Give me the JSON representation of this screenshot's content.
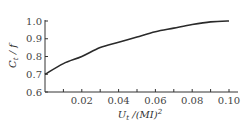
{
  "chart_data": {
    "type": "line",
    "title": "",
    "xlabel": "U_t /(MI)^2",
    "ylabel": "C_t / f",
    "xlim": [
      0,
      0.105
    ],
    "ylim": [
      0.6,
      1.0
    ],
    "x_ticks": [
      "0.02",
      "0.04",
      "0.06",
      "0.08",
      "0.10"
    ],
    "x_tick_values": [
      0.02,
      0.04,
      0.06,
      0.08,
      0.1
    ],
    "y_ticks": [
      "0.6",
      "0.7",
      "0.8",
      "0.9",
      "1.0"
    ],
    "y_tick_values": [
      0.6,
      0.7,
      0.8,
      0.9,
      1.0
    ],
    "grid": false,
    "legend": null,
    "series": [
      {
        "name": "C_t/f",
        "x": [
          0.0,
          0.01,
          0.02,
          0.03,
          0.04,
          0.05,
          0.06,
          0.07,
          0.08,
          0.09,
          0.1
        ],
        "values": [
          0.7,
          0.76,
          0.8,
          0.85,
          0.88,
          0.91,
          0.94,
          0.96,
          0.98,
          0.995,
          1.0
        ]
      }
    ]
  },
  "labels": {
    "ylabel_main": "C",
    "ylabel_sub": "t",
    "ylabel_rest": " / f",
    "xlabel_main": "U",
    "xlabel_sub": "t",
    "xlabel_rest": " /(MI)",
    "xlabel_sup": "2"
  }
}
